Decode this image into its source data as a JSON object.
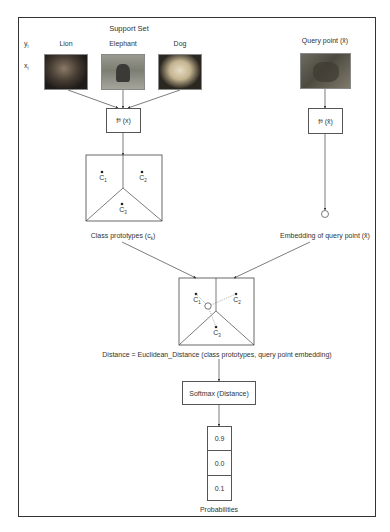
{
  "diagram": {
    "support_set": {
      "title": "Support Set",
      "row_y_label": "y",
      "row_y_sub": "i",
      "row_x_label": "x",
      "row_x_sub": "i",
      "classes": [
        {
          "label": "Lion",
          "image": "lion-photo"
        },
        {
          "label": "Elephant",
          "image": "elephant-photo"
        },
        {
          "label": "Dog",
          "image": "dog-photo"
        }
      ]
    },
    "query": {
      "title": "Query point (x̂)",
      "image": "lion-query-photo"
    },
    "embedding_fn": {
      "support_label": "f",
      "support_sub": "θ",
      "support_arg": "(x)",
      "query_label": "f",
      "query_sub": "θ",
      "query_arg": "(x̂)"
    },
    "prototypes": {
      "caption": "Class prototypes (c",
      "caption_sub": "k",
      "caption_end": ")",
      "points": [
        {
          "label": "C",
          "sub": "1"
        },
        {
          "label": "C",
          "sub": "2"
        },
        {
          "label": "C",
          "sub": "3"
        }
      ]
    },
    "query_embedding": {
      "caption": "Embedding of query point (x̂)"
    },
    "distance": {
      "caption": "Distance = Euclidean_Distance (class prototypes, query point embedding)",
      "points": [
        {
          "label": "C",
          "sub": "1"
        },
        {
          "label": "C",
          "sub": "2"
        },
        {
          "label": "C",
          "sub": "3"
        }
      ]
    },
    "softmax": {
      "label": "Softmax (Distance)"
    },
    "probabilities": {
      "values": [
        "0.9",
        "0.0",
        "0.1"
      ],
      "caption": "Probabilities"
    }
  }
}
